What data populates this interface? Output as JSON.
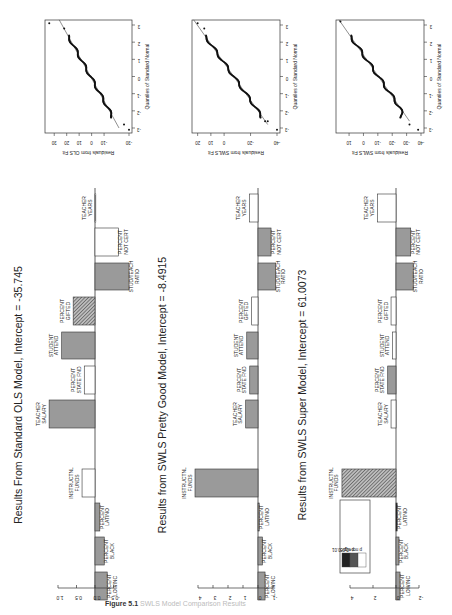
{
  "figure": {
    "caption_label": "Figure 5.1",
    "caption_text": "SWLS Model Comparison Results",
    "colors": {
      "bar_sig_001": "#222222",
      "bar_sig_005": "#9a9a9a",
      "bar_not_sig": "#ffffff",
      "hatch": "#555555",
      "axis": "#333333",
      "qq_points": "#111111",
      "qq_line": "#444444"
    }
  },
  "chart_data": [
    {
      "type": "bar",
      "title": "Results From Standard OLS Model, Intercept = -35.745",
      "categories": [
        "PERCENT LOWINC",
        "PERCENT BLACK",
        "PERCENT LATINO",
        "INSTRUCTNL FUNDS",
        "TEACHER SALARY",
        "PERCENT STATE FND",
        "STUDENT ATTEND",
        "PERCENT GIFTED",
        "STUD/TEACH RATIO",
        "PERCENT NOT CERT",
        "TEACHER YEARS"
      ],
      "values": [
        -0.33,
        -0.25,
        -0.13,
        0.35,
        1.24,
        0.29,
        0.9,
        0.59,
        -0.92,
        -0.63,
        0.0
      ],
      "significance": [
        "p<0.05",
        "p<0.05",
        "p<0.05",
        "p not sig",
        "p<0.05",
        "p not sig",
        "p<0.05",
        "p<0.01 hatched",
        "p<0.05",
        "p not sig",
        "p not sig"
      ],
      "ylim": [
        -0.5,
        1.0
      ],
      "yticks": [
        "1.0",
        "0.5",
        "0.0",
        "-0.5"
      ],
      "ytick_values": [
        1.0,
        0.5,
        0.0,
        -0.5
      ],
      "orientation": "rotated-90"
    },
    {
      "type": "bar",
      "title": "Results from SWLS Pretty Good Model, Intercept = -8.4915",
      "categories": [
        "PERCENT LOWINC",
        "PERCENT BLACK",
        "PERCENT LATINO",
        "INSTRUCTNL FUNDS",
        "TEACHER SALARY",
        "PERCENT STATE FND",
        "STUDENT ATTEND",
        "PERCENT GIFTED",
        "STUD/TEACH RATIO",
        "PERCENT NOT CERT",
        "TEACHER YEARS"
      ],
      "values": [
        -0.47,
        -0.29,
        -0.08,
        4.2,
        0.82,
        0.55,
        0.75,
        0.42,
        -1.18,
        -0.87,
        0.58
      ],
      "significance": [
        "p<0.05",
        "p<0.05",
        "p<0.05",
        "p<0.05",
        "p<0.05",
        "p<0.05",
        "p<0.05",
        "p not sig",
        "p<0.05",
        "p<0.05",
        "p not sig"
      ],
      "ylim": [
        -1,
        4
      ],
      "yticks": [
        "4",
        "3",
        "2",
        "1",
        "0",
        "-1"
      ],
      "ytick_values": [
        4,
        3,
        2,
        1,
        0,
        -1
      ],
      "orientation": "rotated-90"
    },
    {
      "type": "bar",
      "title": "Results from SWLS Super Model, Intercept = 61.0073",
      "categories": [
        "PERCENT LOWINC",
        "PERCENT BLACK",
        "PERCENT LATINO",
        "INSTRUCTNL FUNDS",
        "TEACHER SALARY",
        "PERCENT STATE FND",
        "STUDENT ATTEND",
        "PERCENT GIFTED",
        "STUD/TEACH RATIO",
        "PERCENT NOT CERT",
        "TEACHER YEARS"
      ],
      "values": [
        -0.35,
        -0.26,
        -0.1,
        4.7,
        0.43,
        0.72,
        0.29,
        0.43,
        -1.5,
        -1.28,
        1.62
      ],
      "significance": [
        "p<0.05",
        "p<0.05",
        "p<0.01",
        "p<0.01 hatched",
        "p not sig",
        "p<0.05",
        "p not sig",
        "p not sig",
        "p<0.05",
        "p<0.05",
        "p not sig"
      ],
      "ylim": [
        -2,
        4
      ],
      "yticks": [
        "4",
        "2",
        "0",
        "-2"
      ],
      "ytick_values": [
        4,
        2,
        0,
        -2
      ],
      "legend": [
        "p<0.01",
        "p<0.05",
        "p not sig"
      ],
      "orientation": "rotated-90"
    },
    {
      "type": "scatter",
      "title": "Normal Q-Q Plot (OLS)",
      "xlabel": "Quantiles of Standard Normal",
      "ylabel": "Residuals from OLS Fit",
      "xticks": [
        "-3",
        "-2",
        "-1",
        "0",
        "1",
        "2",
        "3"
      ],
      "yticks": [
        "30",
        "20",
        "10",
        "0",
        "-10",
        "-30"
      ],
      "xlim": [
        -3,
        3
      ],
      "ylim": [
        -30,
        35
      ],
      "fit_line": [
        [
          -3,
          -22
        ],
        [
          3.3,
          26
        ]
      ],
      "outliers": [
        [
          3.1,
          34
        ],
        [
          2.8,
          22
        ],
        [
          -2.8,
          -26
        ],
        [
          -3.1,
          -30
        ]
      ]
    },
    {
      "type": "scatter",
      "title": "Normal Q-Q Plot (SWLS Pretty Good)",
      "xlabel": "Quantiles of Standard Normal",
      "ylabel": "Residuals from SWLS Fit",
      "xticks": [
        "-3",
        "-2",
        "-1",
        "0",
        "1",
        "2",
        "3"
      ],
      "yticks": [
        "20",
        "10",
        "0",
        "-20",
        "-40"
      ],
      "xlim": [
        -3,
        3
      ],
      "ylim": [
        -40,
        22
      ],
      "fit_line": [
        [
          -2.8,
          -33
        ],
        [
          3.3,
          23
        ]
      ],
      "outliers": [
        [
          3.1,
          20
        ],
        [
          2.8,
          15
        ],
        [
          -2.6,
          -31
        ],
        [
          -2.6,
          -33
        ],
        [
          -3.1,
          -40
        ]
      ]
    },
    {
      "type": "scatter",
      "title": "Normal Q-Q Plot (SWLS Super)",
      "xlabel": "Quantiles of Standard Normal",
      "ylabel": "Residuals from SWLS Fit",
      "xticks": [
        "-3",
        "-2",
        "-1",
        "0",
        "1",
        "2",
        "3"
      ],
      "yticks": [
        "10",
        "0",
        "-10",
        "-20",
        "-30",
        "-40"
      ],
      "xlim": [
        -3,
        3
      ],
      "ylim": [
        -40,
        17
      ],
      "fit_line": [
        [
          -2.6,
          -32
        ],
        [
          3.3,
          17
        ]
      ],
      "outliers": [
        [
          3.2,
          16
        ],
        [
          -2.8,
          -32
        ],
        [
          -3.1,
          -38
        ]
      ]
    }
  ],
  "layout": {
    "bar_panels": [
      {
        "baseline_x": 95,
        "px_per_unit": 37,
        "title_x": 22,
        "axis_tick_y": 588,
        "label_offset": 14
      },
      {
        "baseline_x": 258,
        "px_per_unit": 15,
        "title_x": 166,
        "axis_tick_y": 588,
        "label_offset": 14
      },
      {
        "baseline_x": 396,
        "px_per_unit": 11.5,
        "title_x": 306,
        "axis_tick_y": 588,
        "label_offset": 14
      }
    ],
    "bar_rows_y": [
      [
        572,
        600
      ],
      [
        537,
        565
      ],
      [
        503,
        531
      ],
      [
        469,
        497
      ],
      [
        400,
        428
      ],
      [
        366,
        394
      ],
      [
        332,
        359
      ],
      [
        297,
        325
      ],
      [
        263,
        290
      ],
      [
        228,
        256
      ],
      [
        194,
        222
      ]
    ],
    "qq_panels": [
      {
        "box": [
          45,
          20,
          87,
          113
        ]
      },
      {
        "box": [
          192,
          20,
          88,
          113
        ]
      },
      {
        "box": [
          336,
          20,
          88,
          113
        ]
      }
    ]
  }
}
